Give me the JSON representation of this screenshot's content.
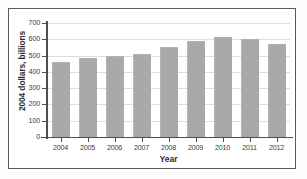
{
  "chart_data": {
    "type": "bar",
    "title": "",
    "xlabel": "Year",
    "ylabel": "2004 dollars, billions",
    "categories": [
      "2004",
      "2005",
      "2006",
      "2007",
      "2008",
      "2009",
      "2010",
      "2011",
      "2012"
    ],
    "values": [
      455,
      480,
      490,
      505,
      545,
      585,
      605,
      595,
      562
    ],
    "ylim": [
      0,
      700
    ],
    "ytick_labels": [
      "0",
      "100",
      "200",
      "300",
      "400",
      "500",
      "600",
      "700"
    ],
    "ytick_values": [
      0,
      100,
      200,
      300,
      400,
      500,
      600,
      700
    ],
    "grid": true,
    "legend": "none",
    "bar_color": "#a9a9a7",
    "axis_color": "#4f4f4d",
    "gridline_color": "#ddddda",
    "frame_color": "#5a5a58",
    "background": "#ffffff"
  }
}
